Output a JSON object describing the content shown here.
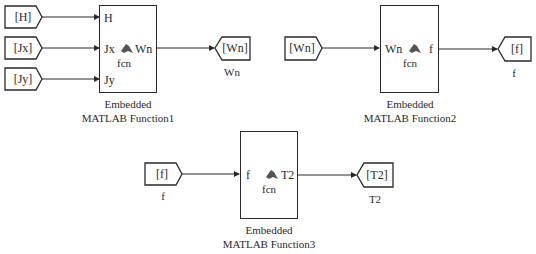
{
  "colors": {
    "line": "#2a2a2a",
    "background": "#ffffff",
    "icon": "#555555"
  },
  "from_blocks": [
    {
      "id": "from-H",
      "label": "[H]"
    },
    {
      "id": "from-Jx",
      "label": "[Jx]"
    },
    {
      "id": "from-Jy",
      "label": "[Jy]"
    },
    {
      "id": "from-Wn",
      "label": "[Wn]"
    },
    {
      "id": "from-f",
      "label": "[f]",
      "sublabel": "f"
    }
  ],
  "goto_blocks": [
    {
      "id": "goto-Wn",
      "label": "[Wn]",
      "sublabel": "Wn"
    },
    {
      "id": "goto-f",
      "label": "[f]",
      "sublabel": "f"
    },
    {
      "id": "goto-T2",
      "label": "[T2]",
      "sublabel": "T2"
    }
  ],
  "functions": [
    {
      "name": "Embedded",
      "name2": "MATLAB Function1",
      "inputs": [
        "H",
        "Jx",
        "Jy"
      ],
      "outputs": [
        "Wn"
      ],
      "body": "fcn"
    },
    {
      "name": "Embedded",
      "name2": "MATLAB Function2",
      "inputs": [
        "Wn"
      ],
      "outputs": [
        "f"
      ],
      "body": "fcn"
    },
    {
      "name": "Embedded",
      "name2": "MATLAB Function3",
      "inputs": [
        "f"
      ],
      "outputs": [
        "T2"
      ],
      "body": "fcn"
    }
  ]
}
